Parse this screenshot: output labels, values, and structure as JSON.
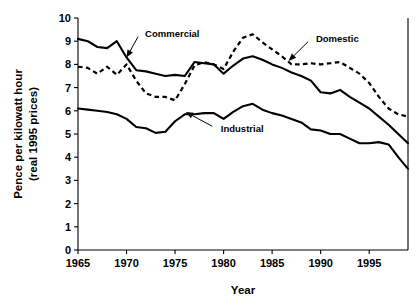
{
  "chart_data": {
    "type": "line",
    "title": "",
    "xlabel": "Year",
    "ylabel": "Pence per kilowatt hour (real 1995 prices)",
    "ylabel_line1": "Pence per kilowatt hour",
    "ylabel_line2": "(real 1995 prices)",
    "xlim": [
      1965,
      1999
    ],
    "ylim": [
      0,
      10
    ],
    "ytick_values": [
      0,
      1,
      2,
      3,
      4,
      5,
      6,
      7,
      8,
      9,
      10
    ],
    "ytick_labels": [
      "0",
      "1",
      "2",
      "3",
      "4",
      "5",
      "6",
      "7",
      "8",
      "9",
      "10"
    ],
    "xtick_values": [
      1965,
      1970,
      1975,
      1980,
      1985,
      1990,
      1995
    ],
    "xtick_labels": [
      "1965",
      "1970",
      "1975",
      "1980",
      "1985",
      "1990",
      "1995"
    ],
    "grid": false,
    "legend_position": "inline-annotations",
    "x": [
      1965,
      1966,
      1967,
      1968,
      1969,
      1970,
      1971,
      1972,
      1973,
      1974,
      1975,
      1976,
      1977,
      1978,
      1979,
      1980,
      1981,
      1982,
      1983,
      1984,
      1985,
      1986,
      1987,
      1988,
      1989,
      1990,
      1991,
      1992,
      1993,
      1994,
      1995,
      1996,
      1997,
      1998,
      1999
    ],
    "series": [
      {
        "name": "Commercial",
        "style": "solid",
        "color": "#000000",
        "values": [
          9.1,
          9.0,
          8.75,
          8.7,
          9.0,
          8.3,
          7.75,
          7.7,
          7.6,
          7.5,
          7.55,
          7.5,
          8.1,
          8.05,
          8.0,
          7.6,
          7.95,
          8.25,
          8.35,
          8.2,
          8.0,
          7.85,
          7.65,
          7.5,
          7.3,
          6.8,
          6.75,
          6.9,
          6.6,
          6.35,
          6.1,
          5.75,
          5.4,
          5.0,
          4.6
        ]
      },
      {
        "name": "Domestic",
        "style": "dashed",
        "color": "#000000",
        "values": [
          7.9,
          7.85,
          7.6,
          7.9,
          7.55,
          8.0,
          7.3,
          6.75,
          6.6,
          6.6,
          6.45,
          7.15,
          7.95,
          8.1,
          8.0,
          7.8,
          8.55,
          9.15,
          9.3,
          8.95,
          8.65,
          8.35,
          8.0,
          8.0,
          8.05,
          8.0,
          8.05,
          8.1,
          7.85,
          7.6,
          7.2,
          6.6,
          6.1,
          5.85,
          5.75
        ]
      },
      {
        "name": "Industrial",
        "style": "solid",
        "color": "#000000",
        "values": [
          6.1,
          6.05,
          6.0,
          5.95,
          5.85,
          5.65,
          5.3,
          5.25,
          5.05,
          5.1,
          5.55,
          5.85,
          5.85,
          5.9,
          5.9,
          5.65,
          5.95,
          6.2,
          6.3,
          6.05,
          5.9,
          5.8,
          5.65,
          5.5,
          5.2,
          5.15,
          5.0,
          5.0,
          4.8,
          4.6,
          4.6,
          4.65,
          4.55,
          4.0,
          3.5
        ]
      }
    ],
    "annotations": [
      {
        "text": "Commercial",
        "target_x": 1970.0,
        "target_y": 8.3,
        "label_x": 1971.4,
        "label_y": 9.35
      },
      {
        "text": "Domestic",
        "target_x": 1986.7,
        "target_y": 8.15,
        "label_x": 1989.0,
        "label_y": 9.1
      },
      {
        "text": "Industrial",
        "target_x": 1976.1,
        "target_y": 5.95,
        "label_x": 1979.2,
        "label_y": 5.25
      }
    ]
  }
}
